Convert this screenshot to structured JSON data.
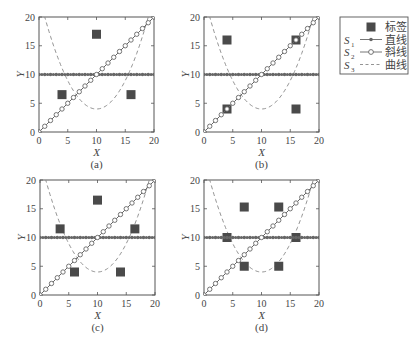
{
  "chart_data": {
    "type": "scatter",
    "title": "",
    "shared": {
      "xlabel": "X",
      "ylabel": "Y",
      "xlim": [
        0,
        20
      ],
      "ylim": [
        0,
        20
      ],
      "xticks": [
        0,
        5,
        10,
        15,
        20
      ],
      "yticks": [
        0,
        5,
        10,
        15,
        20
      ],
      "grid": false,
      "series": [
        {
          "id": "S1",
          "name": "直线",
          "symbol": "S1",
          "style": "solid line with star markers",
          "equation": "y = 10",
          "x": [
            0,
            1,
            2,
            3,
            4,
            5,
            6,
            7,
            8,
            9,
            10,
            11,
            12,
            13,
            14,
            15,
            16,
            17,
            18,
            19,
            20
          ],
          "y": [
            10,
            10,
            10,
            10,
            10,
            10,
            10,
            10,
            10,
            10,
            10,
            10,
            10,
            10,
            10,
            10,
            10,
            10,
            10,
            10,
            10
          ]
        },
        {
          "id": "S2",
          "name": "斜线",
          "symbol": "S2",
          "style": "solid line with circle markers",
          "equation": "y = x",
          "x": [
            0,
            1,
            2,
            3,
            4,
            5,
            6,
            7,
            8,
            9,
            10,
            11,
            12,
            13,
            14,
            15,
            16,
            17,
            18,
            19,
            20
          ],
          "y": [
            0,
            1,
            2,
            3,
            4,
            5,
            6,
            7,
            8,
            9,
            10,
            11,
            12,
            13,
            14,
            15,
            16,
            17,
            18,
            19,
            20
          ]
        },
        {
          "id": "S3",
          "name": "曲线",
          "symbol": "S3",
          "style": "dashed line",
          "equation": "y = 4 + 16*((x-10)/9)^2",
          "x": [
            1,
            4,
            7,
            10,
            13,
            16,
            19
          ],
          "y": [
            20,
            11.1,
            5.8,
            4,
            5.8,
            11.1,
            20
          ]
        }
      ],
      "label_series_name": "标签"
    },
    "panels": [
      {
        "caption": "(a)",
        "labels": [
          {
            "x": 4,
            "y": 6.5
          },
          {
            "x": 10,
            "y": 17
          },
          {
            "x": 16,
            "y": 6.5
          }
        ]
      },
      {
        "caption": "(b)",
        "labels": [
          {
            "x": 4,
            "y": 16
          },
          {
            "x": 4,
            "y": 4
          },
          {
            "x": 16,
            "y": 16
          },
          {
            "x": 16,
            "y": 4
          }
        ]
      },
      {
        "caption": "(c)",
        "labels": [
          {
            "x": 3.5,
            "y": 11.5
          },
          {
            "x": 10,
            "y": 16.5
          },
          {
            "x": 16.5,
            "y": 11.5
          },
          {
            "x": 6,
            "y": 4
          },
          {
            "x": 14,
            "y": 4
          }
        ]
      },
      {
        "caption": "(d)",
        "labels": [
          {
            "x": 4,
            "y": 10
          },
          {
            "x": 7,
            "y": 15.3
          },
          {
            "x": 13,
            "y": 15.3
          },
          {
            "x": 16,
            "y": 10
          },
          {
            "x": 7,
            "y": 5
          },
          {
            "x": 13,
            "y": 5
          }
        ]
      }
    ],
    "legend": {
      "position": "right",
      "entries": [
        {
          "symbol": "",
          "marker": "filled-square",
          "label": "标签"
        },
        {
          "symbol": "S1",
          "marker": "line-star",
          "label": "直线"
        },
        {
          "symbol": "S2",
          "marker": "line-circle",
          "label": "斜线"
        },
        {
          "symbol": "S3",
          "marker": "dashed-line",
          "label": "曲线"
        }
      ]
    }
  },
  "colors": {
    "axis": "#555555",
    "label_marker": "#4a4a4a",
    "line": "#666666",
    "curve": "#888888"
  }
}
